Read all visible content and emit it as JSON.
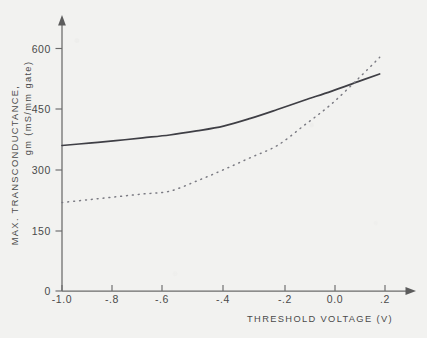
{
  "chart_data": {
    "type": "line",
    "title": "",
    "xlabel": "THRESHOLD VOLTAGE (V)",
    "ylabel": "MAX. TRANSCONDUCTANCE,  gm (mS/mm gate)",
    "xlim": [
      -1.0,
      0.2
    ],
    "ylim": [
      0,
      600
    ],
    "grid": false,
    "legend": "none",
    "xticks": [
      -1.0,
      -0.8,
      -0.6,
      -0.4,
      -0.2,
      0.0,
      0.2
    ],
    "xticklabels": [
      "-1.0",
      "-.8",
      "-.6",
      "-.4",
      "-.2",
      "0.0",
      ".2"
    ],
    "yticks": [
      0,
      150,
      300,
      450,
      600
    ],
    "yticklabels": [
      "0",
      "150",
      "300",
      "450",
      "600"
    ],
    "series": [
      {
        "name": "solid-curve",
        "style": "solid",
        "color": "#3f3f45",
        "x": [
          -1.0,
          -0.9,
          -0.8,
          -0.7,
          -0.6,
          -0.5,
          -0.4,
          -0.3,
          -0.2,
          -0.1,
          0.0,
          0.1,
          0.18
        ],
        "values": [
          360,
          366,
          372,
          379,
          386,
          396,
          408,
          427,
          449,
          472,
          494,
          518,
          537
        ]
      },
      {
        "name": "dotted-curve",
        "style": "dotted",
        "color": "#7a7a82",
        "x": [
          -1.0,
          -0.9,
          -0.8,
          -0.7,
          -0.6,
          -0.5,
          -0.4,
          -0.3,
          -0.2,
          -0.1,
          0.0,
          0.1,
          0.18
        ],
        "values": [
          219,
          226,
          233,
          240,
          247,
          272,
          300,
          330,
          360,
          410,
          462,
          525,
          578
        ]
      }
    ],
    "annotations": [
      {
        "text": "curves cross near Vth = +0.04 V, gm = 522 mS/mm"
      }
    ]
  },
  "axes": {
    "x_title": "THRESHOLD VOLTAGE (V)",
    "y_title_line1": "MAX.  TRANSCONDUCTANCE,",
    "y_title_line2": "gm (mS/mm gate)"
  }
}
